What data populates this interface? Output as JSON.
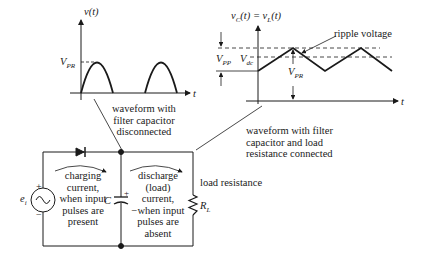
{
  "left_graph": {
    "y_axis_label": "v(t)",
    "x_axis_label": "t",
    "peak_label": "V",
    "peak_sub": "PR",
    "caption_lines": [
      "waveform with",
      "filter capacitor",
      "disconnected"
    ]
  },
  "right_graph": {
    "y_axis_label": "v",
    "y_axis_label_sub": "C",
    "y_axis_label_rest": "(t) = v",
    "y_axis_label_sub2": "L",
    "y_axis_label_end": "(t)",
    "x_axis_label": "t",
    "ripple_label": "ripple voltage",
    "vpp_label": "V",
    "vpp_sub": "PP",
    "vdc_label": "V",
    "vdc_sub": "dc",
    "vpr_label": "V",
    "vpr_sub": "PR",
    "caption_lines": [
      "waveform with filter",
      "capacitor and load",
      "resistance connected"
    ]
  },
  "circuit": {
    "source_label": "e",
    "source_sub": "i",
    "source_plus": "+",
    "source_minus": "−",
    "capacitor_label": "C",
    "capacitor_plus": "+",
    "resistor_label": "R",
    "resistor_sub": "L",
    "load_label": "load resistance",
    "charging_lines": [
      "charging",
      "current,",
      "when input",
      "pulses are",
      "present"
    ],
    "discharge_lines": [
      "discharge",
      "(load)",
      "current,",
      "−when input",
      "pulses are",
      "absent"
    ]
  },
  "colors": {
    "ink": "#1a1a1a",
    "background": "#ffffff"
  }
}
